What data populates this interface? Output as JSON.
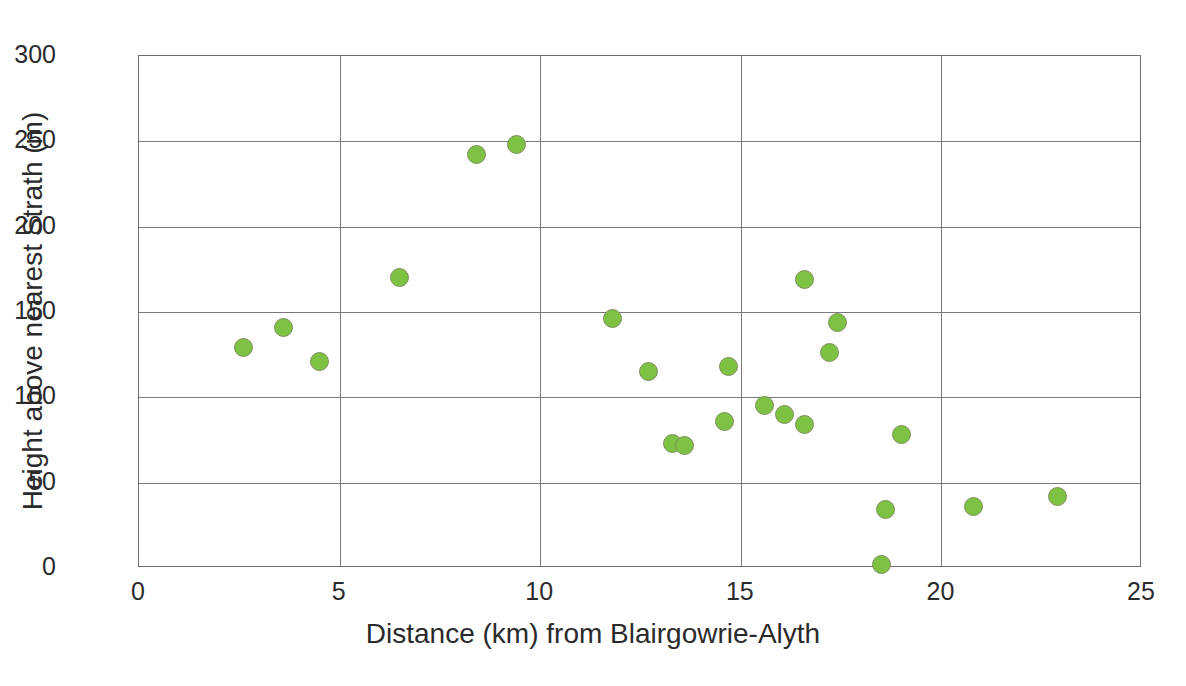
{
  "chart_data": {
    "type": "scatter",
    "title": "",
    "xlabel": "Distance (km) from Blairgowrie-Alyth",
    "ylabel": "Height above nearest Strath (m)",
    "xlim": [
      0,
      25
    ],
    "ylim": [
      0,
      300
    ],
    "xticks": [
      0,
      5,
      10,
      15,
      20,
      25
    ],
    "yticks": [
      0,
      50,
      100,
      150,
      200,
      250,
      300
    ],
    "xtick_labels": [
      "0",
      "5",
      "10",
      "15",
      "20",
      "25"
    ],
    "ytick_labels": [
      "0",
      "50",
      "100",
      "150",
      "200",
      "250",
      "300"
    ],
    "grid": true,
    "legend": "none",
    "marker_color": "#7DC242",
    "marker_edge_color": "#7f8f5e",
    "points": [
      {
        "x": 2.6,
        "y": 129
      },
      {
        "x": 3.6,
        "y": 141
      },
      {
        "x": 4.5,
        "y": 121
      },
      {
        "x": 6.5,
        "y": 170
      },
      {
        "x": 8.4,
        "y": 242
      },
      {
        "x": 9.4,
        "y": 248
      },
      {
        "x": 11.8,
        "y": 146
      },
      {
        "x": 12.7,
        "y": 115
      },
      {
        "x": 13.3,
        "y": 73
      },
      {
        "x": 13.6,
        "y": 72
      },
      {
        "x": 14.6,
        "y": 86
      },
      {
        "x": 14.7,
        "y": 118
      },
      {
        "x": 15.6,
        "y": 95
      },
      {
        "x": 16.1,
        "y": 90
      },
      {
        "x": 16.6,
        "y": 84
      },
      {
        "x": 16.6,
        "y": 169
      },
      {
        "x": 17.2,
        "y": 126
      },
      {
        "x": 17.4,
        "y": 144
      },
      {
        "x": 18.5,
        "y": 2
      },
      {
        "x": 18.6,
        "y": 34
      },
      {
        "x": 19.0,
        "y": 78
      },
      {
        "x": 20.8,
        "y": 36
      },
      {
        "x": 22.9,
        "y": 42
      }
    ]
  },
  "footer": {
    "text": ""
  }
}
